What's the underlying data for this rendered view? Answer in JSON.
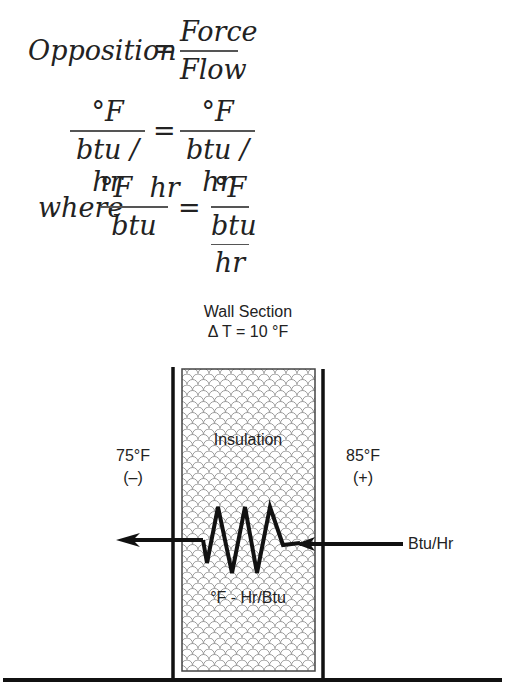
{
  "equations": {
    "line1": {
      "lhs": "Opposition",
      "equals": "=",
      "rhs_num": "Force",
      "rhs_den": "Flow"
    },
    "line2": {
      "lhs_num": "°F",
      "lhs_den": "btu / hr",
      "equals": "=",
      "rhs_num": "°F",
      "rhs_den": "btu / hr"
    },
    "line3": {
      "prefix": "where",
      "lhs_num": "°F  hr",
      "lhs_den": "btu",
      "equals": "=",
      "rhs_num": "°F",
      "rhs_den_num": "btu",
      "rhs_den_den": "hr"
    }
  },
  "diagram": {
    "title": "Wall Section",
    "delta_t": "Δ T = 10 °F",
    "insulation_label": "Insulation",
    "resistance_unit": "°F - Hr/Btu",
    "left_temp": "75°F",
    "left_sign": "(–)",
    "right_temp": "85°F",
    "right_sign": "(+)",
    "flow_label": "Btu/Hr",
    "colors": {
      "line": "#111111",
      "hatch": "#9a9a9a",
      "text": "#222222"
    }
  }
}
